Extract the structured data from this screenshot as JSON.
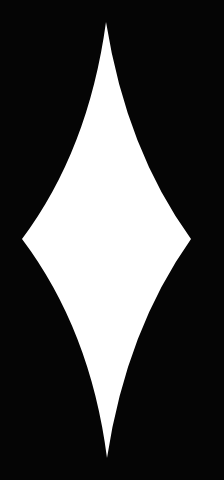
{
  "scene": {
    "background_color": "#050505",
    "shape": {
      "name": "diamond",
      "fill_color": "#ffffff",
      "edges": "concave",
      "points": {
        "top": [
          106,
          22
        ],
        "right": [
          191,
          239
        ],
        "bottom": [
          107,
          458
        ],
        "left": [
          22,
          239
        ]
      }
    }
  }
}
